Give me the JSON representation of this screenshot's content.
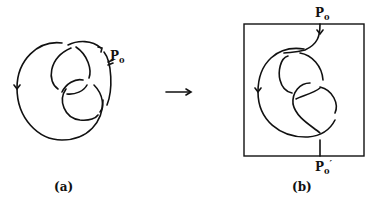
{
  "figure": {
    "panel_a": {
      "caption": "(a)",
      "point_label": "P",
      "point_sub": "0",
      "description": "closed knot diagram with basepoint P0 and orientation arrows"
    },
    "arrow": "→",
    "panel_b": {
      "caption": "(b)",
      "top_label": "P",
      "top_sub": "0",
      "bottom_label": "P",
      "bottom_sub": "0",
      "bottom_prime": "′",
      "description": "knot cut open at P0 drawn as a long knot (tangle) inside a box from P0 to P0'"
    },
    "stroke_color": "#111111",
    "background": "#ffffff"
  }
}
